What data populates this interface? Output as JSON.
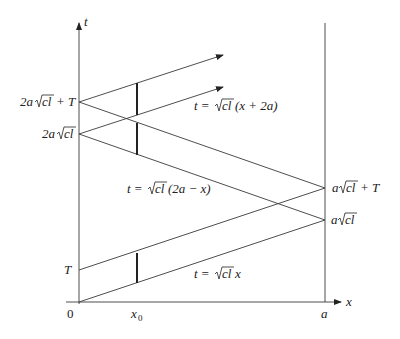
{
  "figure": {
    "axes": {
      "x_label": "x",
      "t_label": "t",
      "origin_label": "0",
      "x0_label": "x",
      "x0_sub": "0",
      "a_label": "a"
    },
    "t_axis_ticks": {
      "T": "T",
      "two_a_sqrt": "2a",
      "two_a_sqrt_T_pre": "2a",
      "two_a_sqrt_T_post": "+ T"
    },
    "right_ticks": {
      "a_sqrt_pre": "a",
      "a_sqrt_T_pre": "a",
      "a_sqrt_T_post": "+ T"
    },
    "sqrt_text": "cl",
    "equations": {
      "eq1_pre": "t = ",
      "eq1_post": "(x + 2a)",
      "eq2_pre": "t = ",
      "eq2_post": "(2a − x)",
      "eq3_pre": "t = ",
      "eq3_post": "x"
    },
    "points": {
      "origin": [
        79,
        302
      ],
      "T": [
        79,
        270
      ],
      "two_a_sqrt_cl": [
        79,
        134
      ],
      "two_a_sqrt_cl_plus_T": [
        79,
        102
      ],
      "a_sqrt_cl": [
        325,
        220
      ],
      "a_sqrt_cl_plus_T": [
        325,
        188
      ],
      "x0": 137,
      "a": 325
    },
    "line_color": "#3a3a3a"
  }
}
